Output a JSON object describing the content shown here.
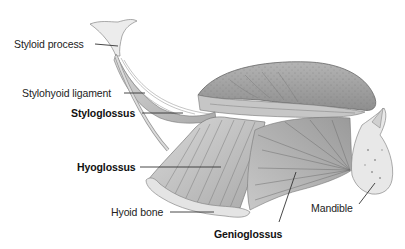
{
  "diagram": {
    "labels": [
      {
        "id": "styloid-process",
        "text": "Styloid process",
        "bold": false
      },
      {
        "id": "stylohyoid-ligament",
        "text": "Stylohyoid ligament",
        "bold": false
      },
      {
        "id": "styloglossus",
        "text": "Styloglossus",
        "bold": true
      },
      {
        "id": "hyoglossus",
        "text": "Hyoglossus",
        "bold": true
      },
      {
        "id": "hyoid-bone",
        "text": "Hyoid bone",
        "bold": false
      },
      {
        "id": "genioglossus",
        "text": "Genioglossus",
        "bold": true
      },
      {
        "id": "mandible",
        "text": "Mandible",
        "bold": false
      }
    ],
    "structures": [
      "tongue",
      "styloid-process",
      "stylohyoid-ligament",
      "styloglossus",
      "hyoglossus",
      "hyoid-bone",
      "genioglossus",
      "mandible"
    ],
    "colors": {
      "background": "#ffffff",
      "text": "#222222",
      "leader_line": "#333333",
      "bone": "#e6e6e6",
      "muscle_light": "#d0d0d0",
      "muscle_mid": "#b8b8b8",
      "muscle_dark": "#8a8a8a",
      "tongue": "#a9a9a9"
    }
  }
}
